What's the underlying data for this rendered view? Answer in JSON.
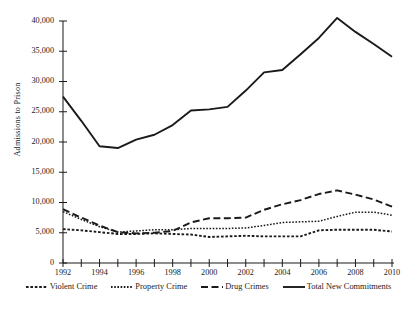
{
  "chart_data": {
    "type": "line",
    "title": "",
    "xlabel": "",
    "ylabel": "Admissions to Prison",
    "x": [
      1992,
      1993,
      1994,
      1995,
      1996,
      1997,
      1998,
      1999,
      2000,
      2001,
      2002,
      2003,
      2004,
      2005,
      2006,
      2007,
      2008,
      2009,
      2010
    ],
    "x_tick_labels": [
      "1992",
      "1994",
      "1996",
      "1998",
      "2000",
      "2002",
      "2004",
      "2006",
      "2008",
      "2010"
    ],
    "xlim": [
      1992,
      2010
    ],
    "ylim": [
      0,
      40000
    ],
    "y_ticks": [
      0,
      5000,
      10000,
      15000,
      20000,
      25000,
      30000,
      35000,
      40000
    ],
    "y_tick_labels": [
      "0",
      "5,000",
      "10,000",
      "15,000",
      "20,000",
      "25,000",
      "30,000",
      "35,000",
      "40,000"
    ],
    "grid": false,
    "legend_position": "bottom",
    "series": [
      {
        "name": "Violent Crime",
        "style": "dotted",
        "color": "#1a1a1a",
        "values": [
          5600,
          5400,
          5100,
          4800,
          4800,
          4900,
          4800,
          4700,
          4300,
          4400,
          4500,
          4400,
          4400,
          4400,
          5400,
          5500,
          5500,
          5500,
          5200
        ]
      },
      {
        "name": "Property Crime",
        "style": "fine-dotted",
        "color": "#1a1a1a",
        "values": [
          8500,
          7200,
          6000,
          5100,
          5300,
          5500,
          5500,
          5700,
          5700,
          5700,
          5800,
          6200,
          6700,
          6800,
          6900,
          7700,
          8400,
          8400,
          7900
        ]
      },
      {
        "name": "Drug Crimes",
        "style": "dashed",
        "color": "#1a1a1a",
        "values": [
          8900,
          7500,
          6200,
          5100,
          4900,
          5000,
          5300,
          6700,
          7400,
          7400,
          7500,
          8800,
          9700,
          10400,
          11400,
          12000,
          11300,
          10500,
          9300
        ]
      },
      {
        "name": "Total New Commitments",
        "style": "solid",
        "color": "#1a1a1a",
        "values": [
          27500,
          23500,
          19300,
          19000,
          20400,
          21200,
          22800,
          25200,
          25400,
          25800,
          28500,
          31500,
          31900,
          34500,
          37200,
          40500,
          38200,
          36200,
          34100
        ]
      }
    ]
  },
  "legend": {
    "items": [
      {
        "label": "Violent Crime"
      },
      {
        "label": "Property Crime"
      },
      {
        "label": "Drug Crimes"
      },
      {
        "label": "Total New Commitments"
      }
    ]
  },
  "axis": {
    "y_title": "Admissions to Prison"
  }
}
